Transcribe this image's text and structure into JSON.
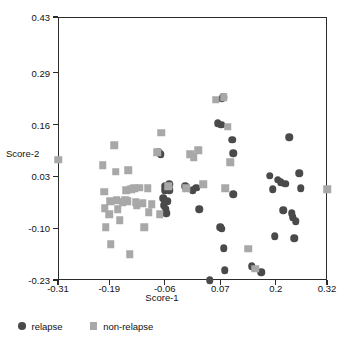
{
  "chart_data": {
    "type": "scatter",
    "title": "",
    "xlabel": "Score-1",
    "ylabel": "Score-2",
    "xlim": [
      -0.31,
      0.32
    ],
    "ylim": [
      -0.23,
      0.43
    ],
    "grid": false,
    "legend_position": "below-axes-left",
    "xticks": [
      -0.31,
      -0.19,
      -0.06,
      0.07,
      0.2,
      0.32
    ],
    "xtick_labels": [
      "-0.31",
      "-0.19",
      "-0.06",
      "0.07",
      "0.2",
      "0.32"
    ],
    "yticks": [
      -0.23,
      -0.1,
      0.03,
      0.16,
      0.29,
      0.43
    ],
    "ytick_labels": [
      "-0.23",
      "-0.10",
      "0.03",
      "0.16",
      "0.29",
      "0.43"
    ],
    "colors": {
      "relapse": "#4a4a4a",
      "non_relapse": "#a8a8a8",
      "axis": "#2b2b2b",
      "background": "#ffffff"
    },
    "series": [
      {
        "name": "relapse",
        "marker": "circle",
        "color": "#4a4a4a",
        "points": [
          [
            -0.075,
            0.09
          ],
          [
            -0.069,
            0.085
          ],
          [
            -0.06,
            0.005
          ],
          [
            -0.06,
            -0.005
          ],
          [
            -0.064,
            -0.025
          ],
          [
            -0.062,
            -0.042
          ],
          [
            -0.058,
            -0.052
          ],
          [
            -0.057,
            -0.063
          ],
          [
            -0.054,
            -0.033
          ],
          [
            -0.05,
            -0.005
          ],
          [
            -0.049,
            0.01
          ],
          [
            -0.012,
            0.005
          ],
          [
            0.005,
            -0.005
          ],
          [
            0.014,
            0.002
          ],
          [
            0.021,
            -0.052
          ],
          [
            0.064,
            0.163
          ],
          [
            0.072,
            0.16
          ],
          [
            0.073,
            0.225
          ],
          [
            0.077,
            0.228
          ],
          [
            0.07,
            -0.098
          ],
          [
            0.074,
            -0.102
          ],
          [
            0.078,
            -0.15
          ],
          [
            0.08,
            -0.205
          ],
          [
            0.045,
            -0.23
          ],
          [
            0.098,
            0.122
          ],
          [
            0.1,
            0.088
          ],
          [
            0.1,
            -0.015
          ],
          [
            0.144,
            -0.195
          ],
          [
            0.186,
            0.032
          ],
          [
            0.193,
            -0.002
          ],
          [
            0.198,
            -0.12
          ],
          [
            0.205,
            0.022
          ],
          [
            0.212,
            0.015
          ],
          [
            0.218,
            -0.055
          ],
          [
            0.222,
            0.012
          ],
          [
            0.232,
            0.128
          ],
          [
            0.238,
            -0.062
          ],
          [
            0.24,
            -0.072
          ],
          [
            0.243,
            -0.125
          ],
          [
            0.247,
            -0.082
          ],
          [
            0.255,
            0.038
          ],
          [
            0.258,
            0.0
          ],
          [
            0.166,
            -0.21
          ]
        ]
      },
      {
        "name": "non-relapse",
        "marker": "square",
        "color": "#a8a8a8",
        "points": [
          [
            -0.31,
            0.072
          ],
          [
            -0.205,
            0.058
          ],
          [
            -0.202,
            -0.008
          ],
          [
            -0.2,
            -0.05
          ],
          [
            -0.198,
            -0.098
          ],
          [
            -0.19,
            -0.065
          ],
          [
            -0.188,
            -0.032
          ],
          [
            -0.186,
            -0.14
          ],
          [
            -0.178,
            0.108
          ],
          [
            -0.175,
            0.042
          ],
          [
            -0.172,
            -0.03
          ],
          [
            -0.17,
            -0.052
          ],
          [
            -0.165,
            -0.08
          ],
          [
            -0.158,
            -0.035
          ],
          [
            -0.152,
            -0.028
          ],
          [
            -0.15,
            -0.005
          ],
          [
            -0.148,
            -0.033
          ],
          [
            -0.145,
            0.045
          ],
          [
            -0.142,
            -0.165
          ],
          [
            -0.138,
            -0.002
          ],
          [
            -0.132,
            0.0
          ],
          [
            -0.128,
            -0.035
          ],
          [
            -0.125,
            -0.042
          ],
          [
            -0.12,
            0.002
          ],
          [
            -0.112,
            -0.038
          ],
          [
            -0.108,
            -0.098
          ],
          [
            -0.1,
            0.0
          ],
          [
            -0.098,
            -0.06
          ],
          [
            -0.09,
            -0.04
          ],
          [
            -0.078,
            0.09
          ],
          [
            -0.072,
            -0.065
          ],
          [
            -0.068,
            0.14
          ],
          [
            -0.052,
            0.005
          ],
          [
            -0.01,
            0.0
          ],
          [
            0.0,
            0.085
          ],
          [
            0.008,
            0.078
          ],
          [
            0.018,
            0.095
          ],
          [
            0.03,
            0.01
          ],
          [
            0.06,
            0.222
          ],
          [
            0.078,
            0.228
          ],
          [
            0.082,
            0.0
          ],
          [
            0.088,
            0.155
          ],
          [
            0.093,
            0.065
          ],
          [
            0.135,
            -0.152
          ],
          [
            0.152,
            -0.202
          ],
          [
            0.32,
            -0.002
          ]
        ]
      }
    ]
  },
  "legend": {
    "items": [
      {
        "label": "relapse",
        "marker": "circle"
      },
      {
        "label": "non-relapse",
        "marker": "square"
      }
    ]
  }
}
